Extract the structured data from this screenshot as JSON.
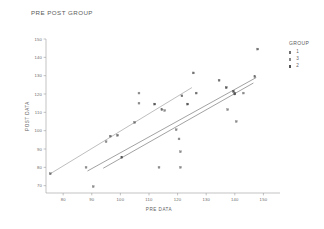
{
  "chart_data": {
    "type": "scatter",
    "title": "PRE POST GROUP",
    "xlabel": "PRE DATA",
    "ylabel": "POST DATA",
    "xlim": [
      74,
      153
    ],
    "ylim": [
      66,
      150
    ],
    "xticks": [
      80,
      90,
      100,
      110,
      120,
      130,
      140,
      150
    ],
    "yticks": [
      70,
      80,
      90,
      100,
      110,
      120,
      130,
      140,
      150
    ],
    "grid": false,
    "legend": {
      "title": "GROUP",
      "position": "right",
      "entries": [
        {
          "label": "1",
          "color": "#707070",
          "marker": "square"
        },
        {
          "label": "3",
          "color": "#8a8a8a",
          "marker": "square"
        },
        {
          "label": "2",
          "color": "#555555",
          "marker": "square"
        }
      ]
    },
    "series": [
      {
        "name": "1",
        "color": "#707070",
        "points": [
          [
            75.5,
            76.5
          ],
          [
            96.5,
            97.0
          ],
          [
            99.0,
            97.5
          ],
          [
            105.0,
            104.5
          ],
          [
            114.5,
            111.5
          ],
          [
            121.5,
            119.0
          ],
          [
            126.5,
            120.5
          ],
          [
            125.5,
            131.5
          ],
          [
            134.5,
            127.5
          ],
          [
            140.0,
            120.5
          ],
          [
            148.0,
            144.5
          ],
          [
            147.0,
            129.5
          ]
        ]
      },
      {
        "name": "3",
        "color": "#8a8a8a",
        "points": [
          [
            88.0,
            80.0
          ],
          [
            90.5,
            69.5
          ],
          [
            95.0,
            94.0
          ],
          [
            106.5,
            120.5
          ],
          [
            106.5,
            115.0
          ],
          [
            115.5,
            111.0
          ],
          [
            119.5,
            100.5
          ],
          [
            120.5,
            95.5
          ],
          [
            121.0,
            88.5
          ],
          [
            121.0,
            80.0
          ],
          [
            113.5,
            80.0
          ],
          [
            137.5,
            111.5
          ],
          [
            140.5,
            105.0
          ],
          [
            143.0,
            120.5
          ]
        ]
      },
      {
        "name": "2",
        "color": "#555555",
        "points": [
          [
            112.0,
            114.5
          ],
          [
            123.5,
            114.5
          ],
          [
            137.0,
            123.5
          ],
          [
            139.5,
            121.5
          ],
          [
            140.0,
            120.0
          ],
          [
            100.5,
            85.5
          ]
        ]
      }
    ],
    "fit_lines": [
      {
        "name": "group-3-fit",
        "color": "#9b9b9b",
        "x0": 75.5,
        "y0": 76.5,
        "x1": 125.0,
        "y1": 123.5
      },
      {
        "name": "group-1-fit",
        "color": "#6f6f6f",
        "x0": 88.5,
        "y0": 78.0,
        "x1": 147.5,
        "y1": 129.0
      },
      {
        "name": "group-2-fit",
        "color": "#6f6f6f",
        "x0": 94.0,
        "y0": 79.5,
        "x1": 146.5,
        "y1": 126.0
      }
    ]
  }
}
